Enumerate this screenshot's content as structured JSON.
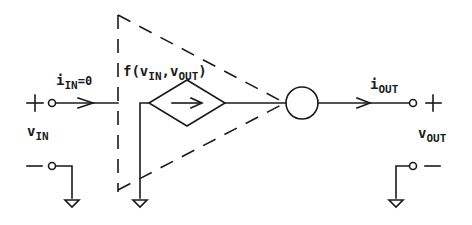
{
  "diagram": {
    "type": "circuit-model",
    "labels": {
      "input_current": {
        "symbol": "i",
        "subscript": "IN",
        "suffix": "=0"
      },
      "dependent_source": {
        "prefix": "f(v",
        "sub1": "IN",
        "mid": ",v",
        "sub2": "OUT",
        "suffix": ")"
      },
      "output_current": {
        "symbol": "i",
        "subscript": "OUT"
      },
      "input_voltage": {
        "symbol": "v",
        "subscript": "IN"
      },
      "output_voltage": {
        "symbol": "v",
        "subscript": "OUT"
      }
    },
    "terminals": {
      "input_plus": "+",
      "input_minus": "—",
      "output_plus": "+",
      "output_minus": "—"
    },
    "elements": [
      "input-port",
      "dashed-amplifier-triangle",
      "dependent-current-source-diamond",
      "output-circle",
      "output-port",
      "ground-symbols"
    ],
    "colors": {
      "ink": "#1a1a1a",
      "background": "#ffffff"
    }
  }
}
